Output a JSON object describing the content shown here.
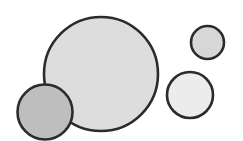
{
  "diagram": {
    "title": "",
    "background": "#ffffff",
    "stroke_color": "#2b2b2b",
    "stroke_width": 2.6,
    "circles": [
      {
        "id": "large-circle",
        "cx": 101,
        "cy": 74,
        "r": 57,
        "fill": "#dddddd",
        "layer": 1
      },
      {
        "id": "dark-circle",
        "cx": 45,
        "cy": 112,
        "r": 27.5,
        "fill": "#bebebe",
        "layer": 2
      },
      {
        "id": "top-right-circle",
        "cx": 207.5,
        "cy": 42.5,
        "r": 16.5,
        "fill": "#d7d7d7",
        "layer": 1
      },
      {
        "id": "middle-right-circle",
        "cx": 190,
        "cy": 95,
        "r": 23,
        "fill": "#ececec",
        "layer": 1
      }
    ]
  }
}
